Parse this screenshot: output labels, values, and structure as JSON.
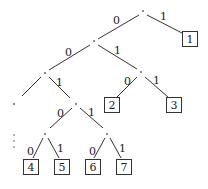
{
  "diagram": {
    "type": "binary-code-tree",
    "nodes": [
      {
        "id": "root",
        "x": 143,
        "y": 12
      },
      {
        "id": "n0",
        "x": 94,
        "y": 42
      },
      {
        "id": "n00",
        "x": 45,
        "y": 73
      },
      {
        "id": "n01",
        "x": 141,
        "y": 72
      },
      {
        "id": "n000",
        "x": 14,
        "y": 104
      },
      {
        "id": "n001",
        "x": 76,
        "y": 103
      },
      {
        "id": "n0010",
        "x": 45,
        "y": 133
      },
      {
        "id": "n0011",
        "x": 107,
        "y": 133
      }
    ],
    "leaves": [
      {
        "id": "leaf1",
        "label": "1",
        "x": 189,
        "y": 39
      },
      {
        "id": "leaf2",
        "label": "2",
        "x": 112,
        "y": 105
      },
      {
        "id": "leaf3",
        "label": "3",
        "x": 173,
        "y": 105
      },
      {
        "id": "leaf4",
        "label": "4",
        "x": 31,
        "y": 167
      },
      {
        "id": "leaf5",
        "label": "5",
        "x": 61,
        "y": 167
      },
      {
        "id": "leaf6",
        "label": "6",
        "x": 92,
        "y": 167
      },
      {
        "id": "leaf7",
        "label": "7",
        "x": 123,
        "y": 167
      }
    ],
    "edges": [
      {
        "from": "root",
        "to": "n0",
        "label": "0"
      },
      {
        "from": "root",
        "to": "leaf1",
        "label": "1"
      },
      {
        "from": "n0",
        "to": "n00",
        "label": "0"
      },
      {
        "from": "n0",
        "to": "n01",
        "label": "1"
      },
      {
        "from": "n00",
        "to": "n000",
        "label": ""
      },
      {
        "from": "n00",
        "to": "n001",
        "label": "1"
      },
      {
        "from": "n01",
        "to": "leaf2",
        "label": "0"
      },
      {
        "from": "n01",
        "to": "leaf3",
        "label": "1"
      },
      {
        "from": "n001",
        "to": "n0010",
        "label": "0"
      },
      {
        "from": "n001",
        "to": "n0011",
        "label": "1"
      },
      {
        "from": "n0010",
        "to": "leaf4",
        "label": "0"
      },
      {
        "from": "n0010",
        "to": "leaf5",
        "label": "1"
      },
      {
        "from": "n0011",
        "to": "leaf6",
        "label": "0"
      },
      {
        "from": "n0011",
        "to": "leaf7",
        "label": "1"
      }
    ],
    "edge_labels": {
      "root_0": "0",
      "root_1": "1",
      "n0_0": "0",
      "n0_1": "1",
      "n00_1": "1",
      "n01_0": "0",
      "n01_1": "1",
      "n001_0": "0",
      "n001_1": "1",
      "n0010_0": "0",
      "n0010_1": "1",
      "n0011_0": "0",
      "n0011_1": "1"
    },
    "leaf_labels": {
      "l1": "1",
      "l2": "2",
      "l3": "3",
      "l4": "4",
      "l5": "5",
      "l6": "6",
      "l7": "7"
    },
    "continuation": "⋮"
  }
}
